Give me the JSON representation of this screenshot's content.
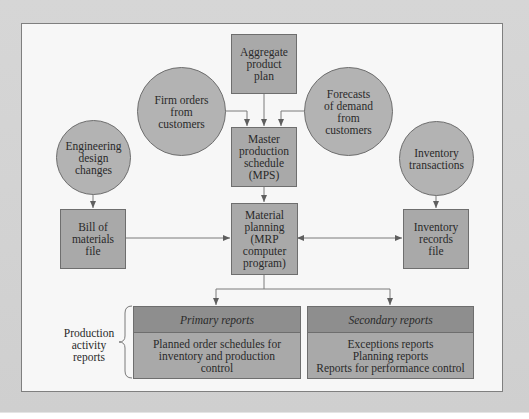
{
  "diagram": {
    "nodes": {
      "aggregate_plan": {
        "label": "Aggregate\nproduct\nplan",
        "shape": "box"
      },
      "firm_orders": {
        "label": "Firm orders\nfrom\ncustomers",
        "shape": "circle"
      },
      "forecasts": {
        "label": "Forecasts\nof demand\nfrom\ncustomers",
        "shape": "circle"
      },
      "mps": {
        "label": "Master\nproduction\nschedule\n(MPS)",
        "shape": "box"
      },
      "engineering_changes": {
        "label": "Engineering\ndesign\nchanges",
        "shape": "circle"
      },
      "inventory_transactions": {
        "label": "Inventory\ntransactions",
        "shape": "circle"
      },
      "bom_file": {
        "label": "Bill of\nmaterials\nfile",
        "shape": "box"
      },
      "mrp": {
        "label": "Material\nplanning\n(MRP\ncomputer\nprogram)",
        "shape": "box"
      },
      "inventory_records": {
        "label": "Inventory\nrecords\nfile",
        "shape": "box"
      }
    },
    "reports": {
      "group_label": "Production\nactivity\nreports",
      "primary": {
        "title": "Primary reports",
        "body": "Planned order schedules for\ninventory and production\ncontrol"
      },
      "secondary": {
        "title": "Secondary reports",
        "body": "Exceptions reports\nPlanning reports\nReports for performance control"
      }
    },
    "edges": [
      {
        "from": "aggregate_plan",
        "to": "mps"
      },
      {
        "from": "firm_orders",
        "to": "mps"
      },
      {
        "from": "forecasts",
        "to": "mps"
      },
      {
        "from": "mps",
        "to": "mrp"
      },
      {
        "from": "engineering_changes",
        "to": "bom_file"
      },
      {
        "from": "bom_file",
        "to": "mrp"
      },
      {
        "from": "inventory_transactions",
        "to": "inventory_records"
      },
      {
        "from": "mrp",
        "to": "inventory_records",
        "bidirectional": true
      },
      {
        "from": "mrp",
        "to": "primary_reports"
      },
      {
        "from": "mrp",
        "to": "secondary_reports"
      }
    ],
    "colors": {
      "box_fill": "#a9a9a9",
      "circle_fill": "#b3b3b3",
      "report_header": "#8e8e8e",
      "line": "#6e6e6e",
      "panel": "#f7f7f7",
      "background": "#d4d4d4"
    }
  }
}
